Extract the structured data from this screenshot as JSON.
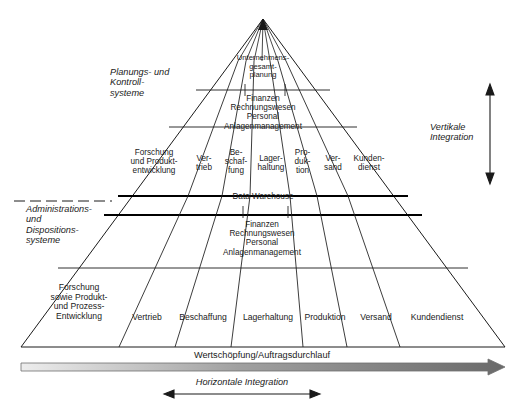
{
  "diagram": {
    "title_hidden": "",
    "side_labels": {
      "planning": "Planungs- und\nKontroll-\nsysteme",
      "administration": "Administrations-\nund\nDispositions-\nsysteme",
      "vertical": "Vertikale\nIntegration",
      "horizontal": "Horizontale Integration"
    },
    "apex": "Unternehmens-\ngesamt-\nplanung",
    "band_upper_functions": "Finanzen\nRechnungswesen\nPersonal\nAnlagenmanagement",
    "band_lower_functions": "Finanzen\nRechnungswesen\nPersonal\nAnlagenmanagement",
    "data_warehouse": "Data Warehouse",
    "value_chain": "Wertschöpfung/Auftragsdurchlauf",
    "upper_columns": [
      "Forschung\nund Produkt-\nentwicklung",
      "Ver-\ntrieb",
      "Be-\nschaf-\nfung",
      "Lager-\nhaltung",
      "Pro-\nduk-\ntion",
      "Ver-\nsand",
      "Kunden-\ndienst"
    ],
    "lower_columns": [
      "Forschung\nsowie Produkt-\nund Prozess-\nEntwicklung",
      "Vertrieb",
      "Beschaffung",
      "Lagerhaltung",
      "Produktion",
      "Versand",
      "Kundendienst"
    ],
    "colors": {
      "line": "#1a1a1a",
      "thick_line": "#000000",
      "gradient_light": "#e8e8e8",
      "gradient_dark": "#6e6e6e",
      "text": "#1a1a1a"
    }
  }
}
